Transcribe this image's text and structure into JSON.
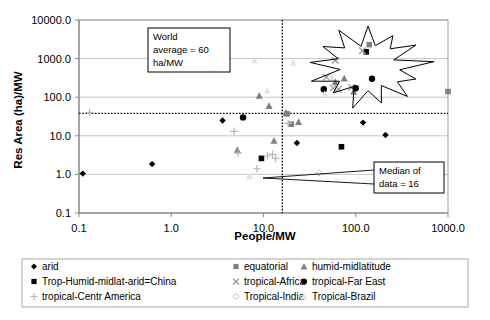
{
  "chart_data": {
    "type": "scatter",
    "title": "",
    "xlabel": "People/MW",
    "ylabel": "Res Area (ha)/MW",
    "xscale": "log",
    "yscale": "log",
    "xlim": [
      0.1,
      1000.0
    ],
    "ylim": [
      0.1,
      10000.0
    ],
    "xticks": [
      "0.1",
      "1.0",
      "10.0",
      "100.0",
      "1000.0"
    ],
    "xtick_values": [
      0.1,
      1.0,
      10.0,
      100.0,
      1000.0
    ],
    "yticks": [
      "0.1",
      "1.0",
      "10.0",
      "100.0",
      "1000.0",
      "10000.0"
    ],
    "ytick_values": [
      0.1,
      1.0,
      10.0,
      100.0,
      1000.0,
      10000.0
    ],
    "grid": "horizontal",
    "legend_position": "bottom",
    "reference_lines": [
      {
        "name": "world-average",
        "orientation": "horizontal",
        "value": 38,
        "label": "World average = 60 ha/MW",
        "style": "dotted"
      },
      {
        "name": "median-of-data",
        "orientation": "vertical",
        "value": 16,
        "label": "Median of data = 16",
        "style": "dotted"
      }
    ],
    "annotations": [
      {
        "name": "world-average-callout",
        "lines": [
          "World",
          "average = 60",
          "ha/MW"
        ]
      },
      {
        "name": "median-callout",
        "lines": [
          "Median of",
          "data = 16"
        ]
      },
      {
        "name": "starburst-highlight",
        "shape": "star-burst",
        "note": "highlighted cluster of tropical points"
      }
    ],
    "series": [
      {
        "name": "arid",
        "marker": "diamond",
        "color": "#000000",
        "points": [
          {
            "x": 0.11,
            "y": 1.05
          },
          {
            "x": 0.62,
            "y": 1.85
          },
          {
            "x": 3.6,
            "y": 25.0
          },
          {
            "x": 23.0,
            "y": 6.5
          },
          {
            "x": 120.0,
            "y": 22.0
          },
          {
            "x": 210.0,
            "y": 10.5
          }
        ]
      },
      {
        "name": "equatorial",
        "marker": "square",
        "color": "#808080",
        "points": [
          {
            "x": 18.0,
            "y": 37.0
          },
          {
            "x": 20.0,
            "y": 20.0
          },
          {
            "x": 140.0,
            "y": 2300.0
          },
          {
            "x": 1000.0,
            "y": 140.0
          }
        ]
      },
      {
        "name": "humid-midlatitude",
        "marker": "triangle",
        "color": "#7f7f7f",
        "points": [
          {
            "x": 5.2,
            "y": 4.3
          },
          {
            "x": 9.0,
            "y": 110.0
          },
          {
            "x": 11.5,
            "y": 60.0
          },
          {
            "x": 13.0,
            "y": 7.5
          },
          {
            "x": 17.5,
            "y": 40.0
          },
          {
            "x": 24.0,
            "y": 23.0
          },
          {
            "x": 60.0,
            "y": 250.0
          },
          {
            "x": 75.0,
            "y": 310.0
          },
          {
            "x": 95.0,
            "y": 140.0
          }
        ]
      },
      {
        "name": "Trop-Humid-midlat-arid=China",
        "marker": "square",
        "color": "#000000",
        "points": [
          {
            "x": 9.5,
            "y": 2.6
          },
          {
            "x": 130.0,
            "y": 1500.0
          },
          {
            "x": 70.0,
            "y": 5.2
          }
        ]
      },
      {
        "name": "tropical-Africa",
        "marker": "cross-x",
        "color": "#9a9a9a",
        "points": [
          {
            "x": 60.0,
            "y": 900.0
          },
          {
            "x": 118.0,
            "y": 1600.0
          },
          {
            "x": 48.0,
            "y": 330.0
          },
          {
            "x": 57.0,
            "y": 175.0
          },
          {
            "x": 65.0,
            "y": 160.0
          },
          {
            "x": 90.0,
            "y": 180.0
          }
        ]
      },
      {
        "name": "tropical-Far East",
        "marker": "circle",
        "color": "#000000",
        "points": [
          {
            "x": 6.0,
            "y": 30.0
          },
          {
            "x": 45.0,
            "y": 160.0
          },
          {
            "x": 100.0,
            "y": 170.0
          },
          {
            "x": 150.0,
            "y": 300.0
          }
        ]
      },
      {
        "name": "tropical-Centr America",
        "marker": "plus",
        "color": "#b5b5b5",
        "points": [
          {
            "x": 0.13,
            "y": 40.0
          },
          {
            "x": 4.8,
            "y": 13.0
          },
          {
            "x": 5.3,
            "y": 3.6
          },
          {
            "x": 11.0,
            "y": 3.0
          },
          {
            "x": 12.5,
            "y": 3.3
          },
          {
            "x": 13.5,
            "y": 2.6
          },
          {
            "x": 18.5,
            "y": 21.0
          },
          {
            "x": 8.5,
            "y": 1.4
          }
        ]
      },
      {
        "name": "Tropical-India",
        "marker": "diamond-open",
        "color": "#bdbdbd",
        "points": [
          {
            "x": 40.0,
            "y": 1.1
          }
        ]
      },
      {
        "name": "Tropical-Brazil",
        "marker": "triangle-light",
        "color": "#e4e4e4",
        "points": [
          {
            "x": 2.6,
            "y": 900.0
          },
          {
            "x": 8.0,
            "y": 900.0
          },
          {
            "x": 11.0,
            "y": 150.0
          },
          {
            "x": 21.0,
            "y": 800.0
          },
          {
            "x": 55.0,
            "y": 330.0
          },
          {
            "x": 46.0,
            "y": 120.0
          },
          {
            "x": 7.0,
            "y": 0.9
          }
        ]
      }
    ]
  },
  "axes": {
    "x_title": "People/MW",
    "y_title": "Res Area (ha)/MW",
    "x_tick_labels": [
      "0.1",
      "1.0",
      "10.0",
      "100.0",
      "1000.0"
    ],
    "y_tick_labels": [
      "10000.0",
      "1000.0",
      "100.0",
      "10.0",
      "1.0",
      "0.1"
    ]
  },
  "callouts": {
    "world_average": {
      "line1": "World",
      "line2": "average = 60",
      "line3": "ha/MW"
    },
    "median": {
      "line1": "Median of",
      "line2": "data = 16"
    }
  },
  "legend": {
    "entries": [
      {
        "label": "arid",
        "marker": "diamond",
        "color": "#000000"
      },
      {
        "label": "equatorial",
        "marker": "square",
        "color": "#808080"
      },
      {
        "label": "humid-midlatitude",
        "marker": "triangle",
        "color": "#7f7f7f"
      },
      {
        "label": "Trop-Humid-midlat-arid=China",
        "marker": "square",
        "color": "#000000"
      },
      {
        "label": "tropical-Africa",
        "marker": "cross-x",
        "color": "#9a9a9a"
      },
      {
        "label": "tropical-Far East",
        "marker": "circle",
        "color": "#000000"
      },
      {
        "label": "tropical-Centr America",
        "marker": "plus",
        "color": "#b5b5b5"
      },
      {
        "label": "Tropical-India",
        "marker": "diamond-open",
        "color": "#bdbdbd"
      },
      {
        "label": "Tropical-Brazil",
        "marker": "triangle-light",
        "color": "#e4e4e4"
      }
    ]
  }
}
